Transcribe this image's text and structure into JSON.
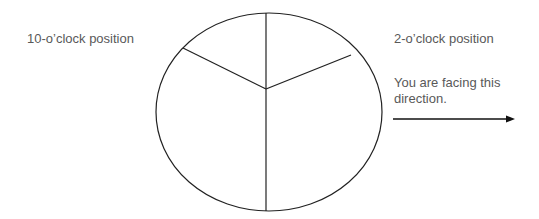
{
  "diagram": {
    "labels": {
      "ten_oclock": "10-o’clock position",
      "two_oclock": "2-o’clock position",
      "facing_line1": "You are facing this",
      "facing_line2": "direction."
    },
    "colors": {
      "text": "#595959",
      "lines": "#222222",
      "background": "#ffffff"
    },
    "shapes": {
      "circle": "clock-face-divided-into-three-sections",
      "arrow": "right-pointing-direction-arrow"
    }
  }
}
